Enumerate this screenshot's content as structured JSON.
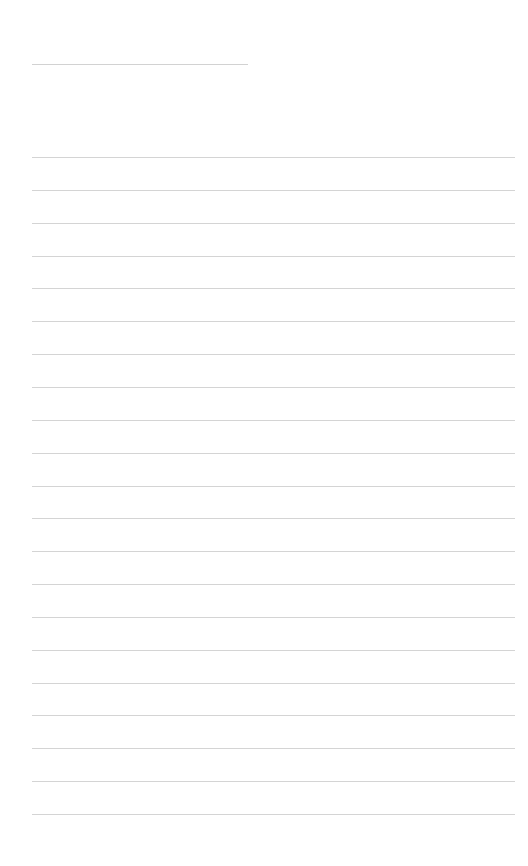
{
  "page": {
    "type": "lined-paper",
    "title_line": {
      "text": ""
    },
    "ruled_line_count": 21,
    "line_color": "#d4d4d4",
    "lines": [
      "",
      "",
      "",
      "",
      "",
      "",
      "",
      "",
      "",
      "",
      "",
      "",
      "",
      "",
      "",
      "",
      "",
      "",
      "",
      "",
      ""
    ]
  }
}
